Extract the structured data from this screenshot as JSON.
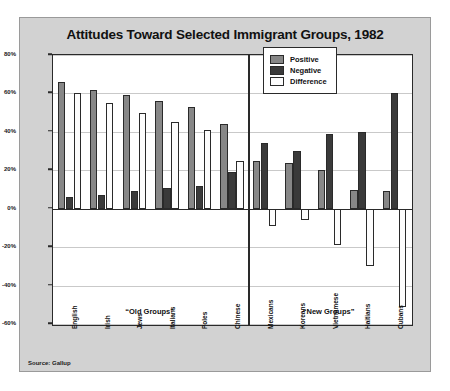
{
  "chart_data": {
    "type": "bar",
    "title": "Attitudes Toward Selected Immigrant Groups, 1982",
    "xlabel": "",
    "ylabel": "",
    "ylim": [
      -60,
      80
    ],
    "ytick_labels": [
      "80%",
      "60%",
      "40%",
      "20%",
      "0%",
      "-20%",
      "-40%",
      "-60%"
    ],
    "yticks": [
      80,
      60,
      40,
      20,
      0,
      -20,
      -40,
      -60
    ],
    "grid": true,
    "legend_position": "top-center-right",
    "categories": [
      "English",
      "Irish",
      "Jews",
      "Italians",
      "Poles",
      "Chinese",
      "Mexicans",
      "Koreans",
      "Vietnamese",
      "Haitians",
      "Cubans"
    ],
    "series": [
      {
        "name": "Positive",
        "color": "#878787",
        "values": [
          66,
          62,
          59,
          56,
          53,
          44,
          25,
          24,
          20,
          10,
          9
        ]
      },
      {
        "name": "Negative",
        "color": "#3a3a3a",
        "values": [
          6,
          7,
          9,
          11,
          12,
          19,
          34,
          30,
          39,
          40,
          60
        ]
      },
      {
        "name": "Difference",
        "color": "#fdfdfd",
        "values": [
          60,
          55,
          50,
          45,
          41,
          25,
          -9,
          -6,
          -19,
          -30,
          -51
        ]
      }
    ],
    "sections": [
      {
        "label": "“Old Groups”",
        "categories": [
          "English",
          "Irish",
          "Jews",
          "Italians",
          "Poles",
          "Chinese"
        ]
      },
      {
        "label": "“New Groups”",
        "categories": [
          "Mexicans",
          "Koreans",
          "Vietnamese",
          "Haitians",
          "Cubans"
        ]
      }
    ],
    "source": "Source: Gallup"
  },
  "legend": {
    "items": [
      {
        "label": "Positive"
      },
      {
        "label": "Negative"
      },
      {
        "label": "Difference"
      }
    ]
  }
}
